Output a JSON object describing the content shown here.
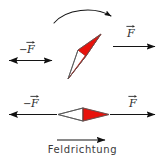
{
  "figure": {
    "title_caption": "Feldrichtung",
    "colors": {
      "needle_red": "#E8120C",
      "needle_outline": "#555555",
      "arrow_stroke": "#1a1a1a",
      "text": "#2b2b2b",
      "background": "#ffffff"
    },
    "rotation_arrow": {
      "name": "rotation-arc-arrow",
      "direction": "clockwise",
      "description": "curved arc arrow above the tilted needle"
    },
    "upper_diagram": {
      "needle": {
        "orientation": "tilted",
        "angle_degrees": 35,
        "red_half": "upper-right",
        "white_half": "lower-left"
      },
      "left_force": {
        "label_minus": "−",
        "label_symbol": "F",
        "arrow_direction": "left"
      },
      "right_force": {
        "label_minus": "",
        "label_symbol": "F",
        "arrow_direction": "right"
      }
    },
    "lower_diagram": {
      "needle": {
        "orientation": "horizontal",
        "angle_degrees": 0,
        "red_half": "right",
        "white_half": "left"
      },
      "left_force": {
        "label_minus": "−",
        "label_symbol": "F",
        "arrow_direction": "left"
      },
      "right_force": {
        "label_minus": "",
        "label_symbol": "F",
        "arrow_direction": "right"
      }
    },
    "field_direction": {
      "label": "Feldrichtung",
      "arrow_direction": "right"
    }
  }
}
